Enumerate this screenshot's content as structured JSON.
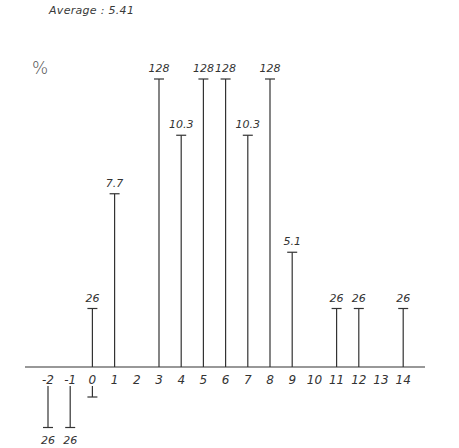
{
  "header": {
    "average_label": "Average : 5.41",
    "y_unit": "%"
  },
  "chart_data": {
    "type": "bar",
    "title": "Average : 5.41",
    "xlabel": "",
    "ylabel": "%",
    "categories": [
      "-2",
      "-1",
      "0",
      "1",
      "2",
      "3",
      "4",
      "5",
      "6",
      "7",
      "8",
      "9",
      "10",
      "11",
      "12",
      "13",
      "14"
    ],
    "values": [
      -2.6,
      -2.6,
      2.6,
      7.7,
      0,
      12.8,
      10.3,
      12.8,
      12.8,
      10.3,
      12.8,
      5.1,
      0,
      2.6,
      2.6,
      0,
      2.6
    ],
    "value_labels": [
      "26",
      "26",
      "26",
      "7.7",
      "",
      "128",
      "10.3",
      "128",
      "128",
      "10.3",
      "128",
      "5.1",
      "",
      "26",
      "26",
      "",
      "26"
    ],
    "ylim": [
      -2.6,
      12.8
    ],
    "grid": false,
    "legend": null
  }
}
